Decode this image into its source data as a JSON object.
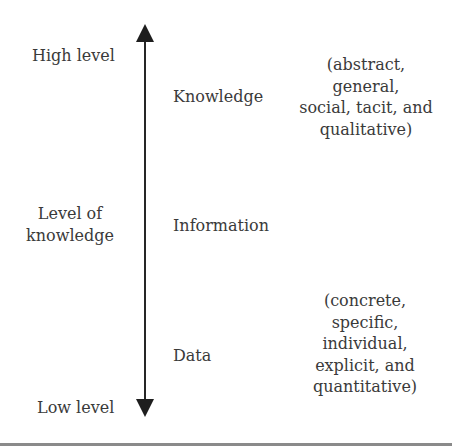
{
  "diagram": {
    "axis": {
      "label_lines": [
        "Level of",
        "knowledge"
      ],
      "top_label": "High level",
      "bottom_label": "Low level",
      "color": "#262626"
    },
    "levels": [
      {
        "name": "Knowledge"
      },
      {
        "name": "Information"
      },
      {
        "name": "Data"
      }
    ],
    "descriptions": {
      "high": [
        "(abstract,",
        "general,",
        "social, tacit, and",
        "qualitative)"
      ],
      "low": [
        "(concrete,",
        "specific,",
        "individual,",
        "explicit, and",
        "quantitative)"
      ]
    }
  }
}
